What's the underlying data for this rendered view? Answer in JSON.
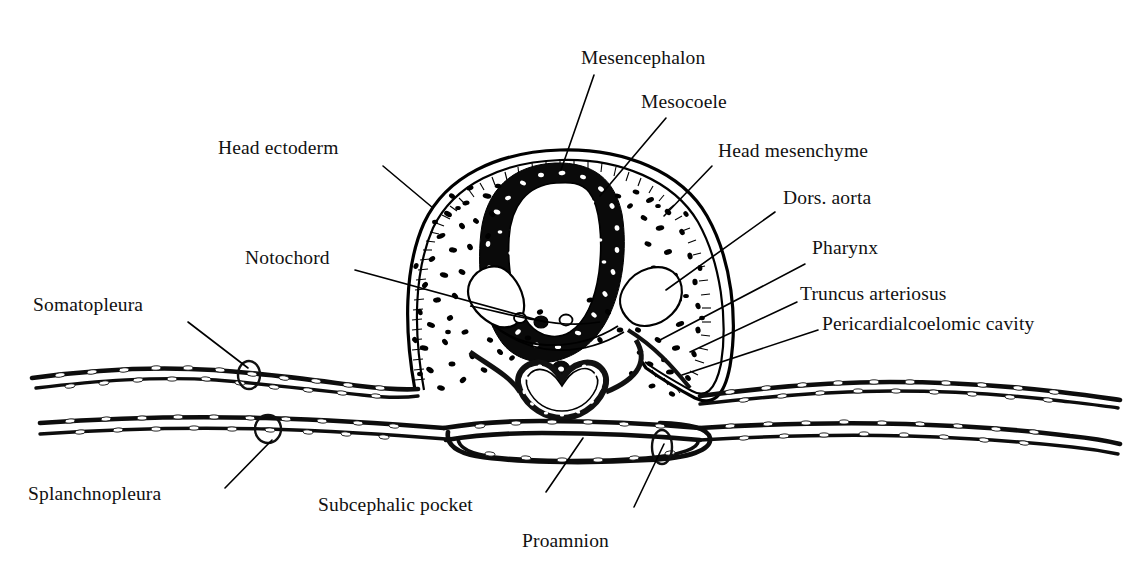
{
  "figure": {
    "background_color": "#ffffff",
    "ink_color": "#111111"
  },
  "labels": {
    "mesencephalon": "Mesencephalon",
    "mesocoele": "Mesocoele",
    "head_mesenchyme": "Head mesenchyme",
    "dors_aorta": "Dors. aorta",
    "pharynx": "Pharynx",
    "truncus_arteriosus": "Truncus arteriosus",
    "pericardial_cavity": "Pericardialcoelomic cavity",
    "head_ectoderm": "Head ectoderm",
    "notochord": "Notochord",
    "somatopleura": "Somatopleura",
    "splanchnopleura": "Splanchnopleura",
    "subcephalic_pocket": "Subcephalic pocket",
    "proamnion": "Proamnion"
  },
  "structures": [
    {
      "name": "mesencephalon",
      "description": "dark-walled neural tube of midbrain"
    },
    {
      "name": "mesocoele",
      "description": "white lumen cavity inside mesencephalon"
    },
    {
      "name": "head-mesenchyme",
      "description": "stippled loose mesenchyme filling head"
    },
    {
      "name": "head-ectoderm",
      "description": "layered epithelial outer boundary"
    },
    {
      "name": "notochord",
      "description": "small dense rod at midline ventral to neural tube"
    },
    {
      "name": "dorsal-aorta",
      "description": "paired lumina lateral to notochord"
    },
    {
      "name": "pharynx",
      "description": "wide flattened foregut lumen"
    },
    {
      "name": "truncus-arteriosus",
      "description": "heart-shaped vessel ventral to pharynx"
    },
    {
      "name": "pericardialcoelomic-cavity",
      "description": "space flanking the heart tube"
    },
    {
      "name": "somatopleura",
      "description": "upper extraembryonic membrane layer"
    },
    {
      "name": "splanchnopleura",
      "description": "lower extraembryonic membrane layer"
    },
    {
      "name": "subcephalic-pocket",
      "description": "recess beneath the head fold"
    },
    {
      "name": "proamnion",
      "description": "membrane-free area ahead of the head"
    }
  ]
}
